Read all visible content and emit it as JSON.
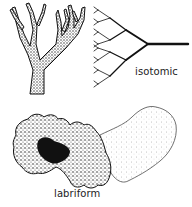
{
  "figure": {
    "panels": [
      {
        "id": "branching",
        "label": ""
      },
      {
        "id": "isotomic",
        "label": "isotomic"
      },
      {
        "id": "labriform",
        "label": "labriform"
      }
    ]
  },
  "colors": {
    "ink": "#111111",
    "background": "#ffffff"
  }
}
